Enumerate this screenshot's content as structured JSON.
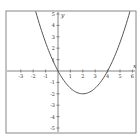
{
  "chart_data": {
    "type": "line",
    "title": "",
    "xlabel": "x",
    "ylabel": "y",
    "xlim": [
      -4.3,
      6.2
    ],
    "ylim": [
      -5.3,
      5.3
    ],
    "grid": false,
    "x_ticks": [
      -3,
      -2,
      -1,
      1,
      2,
      3,
      4,
      5,
      6
    ],
    "y_ticks": [
      -5,
      -4,
      -3,
      -2,
      -1,
      1,
      2,
      3,
      4,
      5
    ],
    "series": [
      {
        "name": "parabola",
        "function": "y = 0.5x^2 - 2x",
        "x": [
          -1.8,
          -1,
          0,
          1,
          2,
          3,
          4,
          5,
          5.8
        ],
        "y": [
          5.2,
          2.5,
          0,
          -1.5,
          -2,
          -1.5,
          0,
          2.5,
          5.2
        ]
      }
    ],
    "annotations": []
  },
  "colors": {
    "curve": "#555555",
    "axes": "#666666",
    "frame": "#777777"
  }
}
